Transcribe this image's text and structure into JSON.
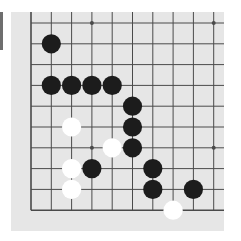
{
  "board": {
    "background": "#e6e6e6",
    "line_color": "#4a4a4a",
    "origin_x": 20,
    "origin_y": 11,
    "spacing_x": 20.3,
    "spacing_y": 20.8,
    "cols": 10,
    "rows": 10,
    "edges": {
      "left": true,
      "top": false,
      "bottom": true,
      "right": false
    },
    "star_points": [
      [
        3,
        0
      ],
      [
        9,
        0
      ],
      [
        3,
        6
      ],
      [
        9,
        6
      ]
    ],
    "stones": [
      {
        "color": "black",
        "col": 1,
        "row": 1
      },
      {
        "color": "black",
        "col": 1,
        "row": 3
      },
      {
        "color": "black",
        "col": 2,
        "row": 3
      },
      {
        "color": "black",
        "col": 3,
        "row": 3
      },
      {
        "color": "black",
        "col": 4,
        "row": 3
      },
      {
        "color": "black",
        "col": 5,
        "row": 4
      },
      {
        "color": "black",
        "col": 5,
        "row": 5
      },
      {
        "color": "black",
        "col": 5,
        "row": 6
      },
      {
        "color": "black",
        "col": 3,
        "row": 7
      },
      {
        "color": "black",
        "col": 6,
        "row": 7
      },
      {
        "color": "black",
        "col": 6,
        "row": 8
      },
      {
        "color": "black",
        "col": 8,
        "row": 8
      },
      {
        "color": "white",
        "col": 2,
        "row": 5
      },
      {
        "color": "white",
        "col": 4,
        "row": 6
      },
      {
        "color": "white",
        "col": 2,
        "row": 7
      },
      {
        "color": "white",
        "col": 2,
        "row": 8
      },
      {
        "color": "white",
        "col": 7,
        "row": 9
      }
    ],
    "colors": {
      "black": "#1c1c1c",
      "white": "#ffffff"
    }
  }
}
